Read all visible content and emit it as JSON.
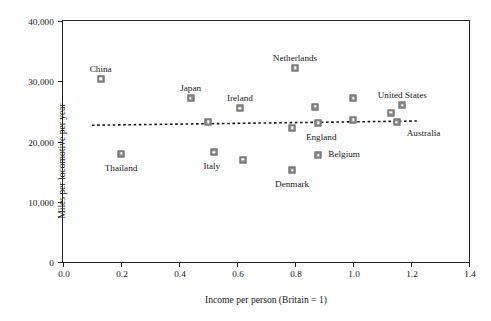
{
  "chart_data": {
    "type": "scatter",
    "title": "",
    "xlabel": "Income per person (Britain = 1)",
    "ylabel": "Miles per locomotive per year",
    "xlim": [
      0.0,
      1.4
    ],
    "ylim": [
      0,
      40000
    ],
    "grid": false,
    "legend": "none",
    "xticks": [
      "0.0",
      "0.2",
      "0.4",
      "0.6",
      "0.8",
      "1.0",
      "1.2",
      "1.4"
    ],
    "xtick_values": [
      0.0,
      0.2,
      0.4,
      0.6,
      0.8,
      1.0,
      1.2,
      1.4
    ],
    "yticks": [
      "0",
      "10,000",
      "20,000",
      "30,000",
      "40,000"
    ],
    "ytick_values": [
      0,
      10000,
      20000,
      30000,
      40000
    ],
    "points": [
      {
        "label": "China",
        "x": 0.13,
        "y": 30400,
        "label_dx": 0,
        "label_dy": -15,
        "label_anchor": "center"
      },
      {
        "label": "Thailand",
        "x": 0.2,
        "y": 18000,
        "label_dx": 0,
        "label_dy": 9,
        "label_anchor": "center"
      },
      {
        "label": "Japan",
        "x": 0.44,
        "y": 27200,
        "label_dx": 0,
        "label_dy": -15,
        "label_anchor": "center"
      },
      {
        "label": "",
        "x": 0.5,
        "y": 23300,
        "label_dx": 0,
        "label_dy": 0,
        "label_anchor": "center"
      },
      {
        "label": "Italy",
        "x": 0.52,
        "y": 18200,
        "label_dx": -2,
        "label_dy": 9,
        "label_anchor": "center"
      },
      {
        "label": "Ireland",
        "x": 0.61,
        "y": 25500,
        "label_dx": 0,
        "label_dy": -15,
        "label_anchor": "center"
      },
      {
        "label": "",
        "x": 0.62,
        "y": 17000,
        "label_dx": 0,
        "label_dy": 0,
        "label_anchor": "center"
      },
      {
        "label": "Denmark",
        "x": 0.79,
        "y": 15200,
        "label_dx": 0,
        "label_dy": 9,
        "label_anchor": "center"
      },
      {
        "label": "Netherlands",
        "x": 0.8,
        "y": 32200,
        "label_dx": 0,
        "label_dy": -15,
        "label_anchor": "center"
      },
      {
        "label": "",
        "x": 0.79,
        "y": 22300,
        "label_dx": 0,
        "label_dy": 0,
        "label_anchor": "center"
      },
      {
        "label": "Belgium",
        "x": 0.88,
        "y": 17700,
        "label_dx": 26,
        "label_dy": -6,
        "label_anchor": "center"
      },
      {
        "label": "",
        "x": 0.87,
        "y": 25800,
        "label_dx": 0,
        "label_dy": 0,
        "label_anchor": "center"
      },
      {
        "label": "England",
        "x": 0.88,
        "y": 23100,
        "label_dx": 3,
        "label_dy": 9,
        "label_anchor": "center"
      },
      {
        "label": "",
        "x": 1.0,
        "y": 27200,
        "label_dx": 0,
        "label_dy": 0,
        "label_anchor": "center"
      },
      {
        "label": "",
        "x": 1.0,
        "y": 23600,
        "label_dx": 0,
        "label_dy": 0,
        "label_anchor": "center"
      },
      {
        "label": "",
        "x": 1.13,
        "y": 24800,
        "label_dx": 0,
        "label_dy": 0,
        "label_anchor": "center"
      },
      {
        "label": "United States",
        "x": 1.17,
        "y": 26000,
        "label_dx": 0,
        "label_dy": -15,
        "label_anchor": "center"
      },
      {
        "label": "Australia",
        "x": 1.15,
        "y": 23200,
        "label_dx": 27,
        "label_dy": 6,
        "label_anchor": "center"
      }
    ],
    "trendline": {
      "style": "dotted",
      "x_start": 0.1,
      "y_start": 22700,
      "x_end": 1.22,
      "y_end": 23400
    },
    "colors": {
      "marker_fill": "#8e8e8e",
      "marker_edge": "#6f6f6f",
      "axis": "#262626",
      "text": "#1a1a1a",
      "background": "#ffffff"
    }
  }
}
